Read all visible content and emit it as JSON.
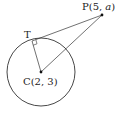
{
  "diagram": {
    "type": "geometry-tangent-to-circle",
    "colors": {
      "stroke": "#333333",
      "text": "#222222",
      "background": "#ffffff"
    },
    "circle": {
      "center_label": "C(2, 3)",
      "cx": 41,
      "cy": 72,
      "r": 34
    },
    "points": {
      "C": {
        "label_prefix": "C",
        "label": "C(2, 3)",
        "x": 41,
        "y": 72
      },
      "P": {
        "label_prefix": "P(5, ",
        "var": "a",
        "label_suffix": ")",
        "x": 102,
        "y": 15
      },
      "T": {
        "label": "T",
        "x": 32,
        "y": 41
      }
    },
    "segments": [
      {
        "from": "T",
        "to": "P"
      },
      {
        "from": "C",
        "to": "P"
      },
      {
        "from": "C",
        "to": "T"
      }
    ],
    "right_angle_at": "T"
  }
}
